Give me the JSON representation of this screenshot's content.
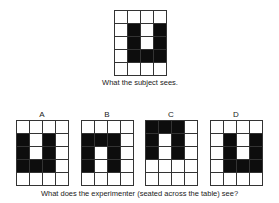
{
  "subject_view": {
    "caption": "What the subject sees.",
    "grid": [
      [
        0,
        0,
        0,
        0
      ],
      [
        0,
        1,
        0,
        1
      ],
      [
        0,
        1,
        0,
        1
      ],
      [
        0,
        1,
        1,
        1
      ],
      [
        0,
        0,
        0,
        0
      ]
    ]
  },
  "question": "What does the experimenter (seated across the table) see?",
  "options": [
    {
      "label": "A",
      "grid": [
        [
          0,
          0,
          0,
          0
        ],
        [
          1,
          0,
          1,
          0
        ],
        [
          1,
          0,
          1,
          0
        ],
        [
          1,
          1,
          1,
          0
        ],
        [
          0,
          0,
          0,
          0
        ]
      ]
    },
    {
      "label": "B",
      "grid": [
        [
          0,
          0,
          0,
          0
        ],
        [
          1,
          1,
          1,
          0
        ],
        [
          1,
          0,
          1,
          0
        ],
        [
          1,
          0,
          1,
          0
        ],
        [
          0,
          0,
          0,
          0
        ]
      ]
    },
    {
      "label": "C",
      "grid": [
        [
          1,
          1,
          1,
          0
        ],
        [
          1,
          0,
          1,
          0
        ],
        [
          1,
          0,
          1,
          0
        ],
        [
          0,
          0,
          0,
          0
        ],
        [
          0,
          0,
          0,
          0
        ]
      ]
    },
    {
      "label": "D",
      "grid": [
        [
          0,
          0,
          0,
          0
        ],
        [
          0,
          1,
          0,
          1
        ],
        [
          0,
          1,
          0,
          1
        ],
        [
          0,
          1,
          1,
          1
        ],
        [
          0,
          0,
          0,
          0
        ]
      ]
    }
  ],
  "colors": {
    "filled": "#0d0d0d",
    "empty": "#ffffff",
    "line": "#333333"
  }
}
